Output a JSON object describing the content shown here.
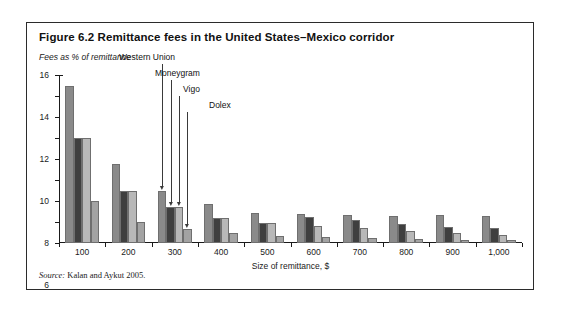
{
  "figure": {
    "title": "Figure 6.2  Remittance fees in the United States–Mexico corridor",
    "source": "Source: Kalan and Aykut 2005."
  },
  "chart_data": {
    "type": "bar",
    "title": "Figure 6.2  Remittance fees in the United States–Mexico corridor",
    "subtitle": "Fees as % of remittance",
    "xlabel": "Size of remittance, $",
    "ylabel": "Fees as % of remittance",
    "categories": [
      "100",
      "200",
      "300",
      "400",
      "500",
      "600",
      "700",
      "800",
      "900",
      "1,000"
    ],
    "ylim": [
      0,
      16
    ],
    "yticks": [
      0,
      2,
      4,
      6,
      8,
      10,
      12,
      14,
      16
    ],
    "grid": false,
    "legend": "none",
    "series": [
      {
        "name": "Western Union",
        "color": "#8a8a8a",
        "values": [
          15.0,
          7.5,
          5.0,
          3.7,
          2.9,
          2.8,
          2.7,
          2.6,
          2.7,
          2.6
        ]
      },
      {
        "name": "Moneygram",
        "color": "#3f3f3f",
        "values": [
          10.0,
          5.0,
          3.4,
          2.4,
          1.9,
          2.5,
          2.2,
          1.8,
          1.5,
          1.4
        ]
      },
      {
        "name": "Vigo",
        "color": "#b8b8b8",
        "values": [
          10.0,
          5.0,
          3.4,
          2.4,
          1.9,
          1.6,
          1.4,
          1.1,
          1.0,
          0.8
        ]
      },
      {
        "name": "Dolex",
        "color": "#a3a3a3",
        "values": [
          4.0,
          2.0,
          1.3,
          1.0,
          0.7,
          0.6,
          0.5,
          0.4,
          0.3,
          0.3
        ]
      }
    ],
    "annotations": [
      {
        "label": "Western Union",
        "series": 0,
        "group": 2
      },
      {
        "label": "Moneygram",
        "series": 1,
        "group": 2
      },
      {
        "label": "Vigo",
        "series": 2,
        "group": 2
      },
      {
        "label": "Dolex",
        "series": 3,
        "group": 2
      }
    ]
  }
}
